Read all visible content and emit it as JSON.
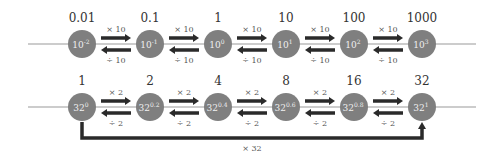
{
  "colors": {
    "node_fill": "#7f7f7f",
    "axis_line": "#9a9a9a",
    "arrow": "#2a2a2a",
    "text": "#333333",
    "node_text": "#f0f0f0"
  },
  "rows": [
    {
      "name": "powers-of-ten",
      "nodes": [
        {
          "value_label": "0.01",
          "base": "10",
          "exponent": "-2"
        },
        {
          "value_label": "0.1",
          "base": "10",
          "exponent": "-1"
        },
        {
          "value_label": "1",
          "base": "10",
          "exponent": "0"
        },
        {
          "value_label": "10",
          "base": "10",
          "exponent": "1"
        },
        {
          "value_label": "100",
          "base": "10",
          "exponent": "2"
        },
        {
          "value_label": "1000",
          "base": "10",
          "exponent": "3"
        }
      ],
      "forward_label": "× 10",
      "backward_label": "÷ 10"
    },
    {
      "name": "powers-of-thirty-two",
      "nodes": [
        {
          "value_label": "1",
          "base": "32",
          "exponent": "0"
        },
        {
          "value_label": "2",
          "base": "32",
          "exponent": "0.2"
        },
        {
          "value_label": "4",
          "base": "32",
          "exponent": "0.4"
        },
        {
          "value_label": "8",
          "base": "32",
          "exponent": "0.6"
        },
        {
          "value_label": "16",
          "base": "32",
          "exponent": "0.8"
        },
        {
          "value_label": "32",
          "base": "32",
          "exponent": "1"
        }
      ],
      "forward_label": "× 2",
      "backward_label": "÷ 2"
    }
  ],
  "bracket": {
    "label": "× 32",
    "from_node": 0,
    "to_node": 5,
    "row": 1
  }
}
